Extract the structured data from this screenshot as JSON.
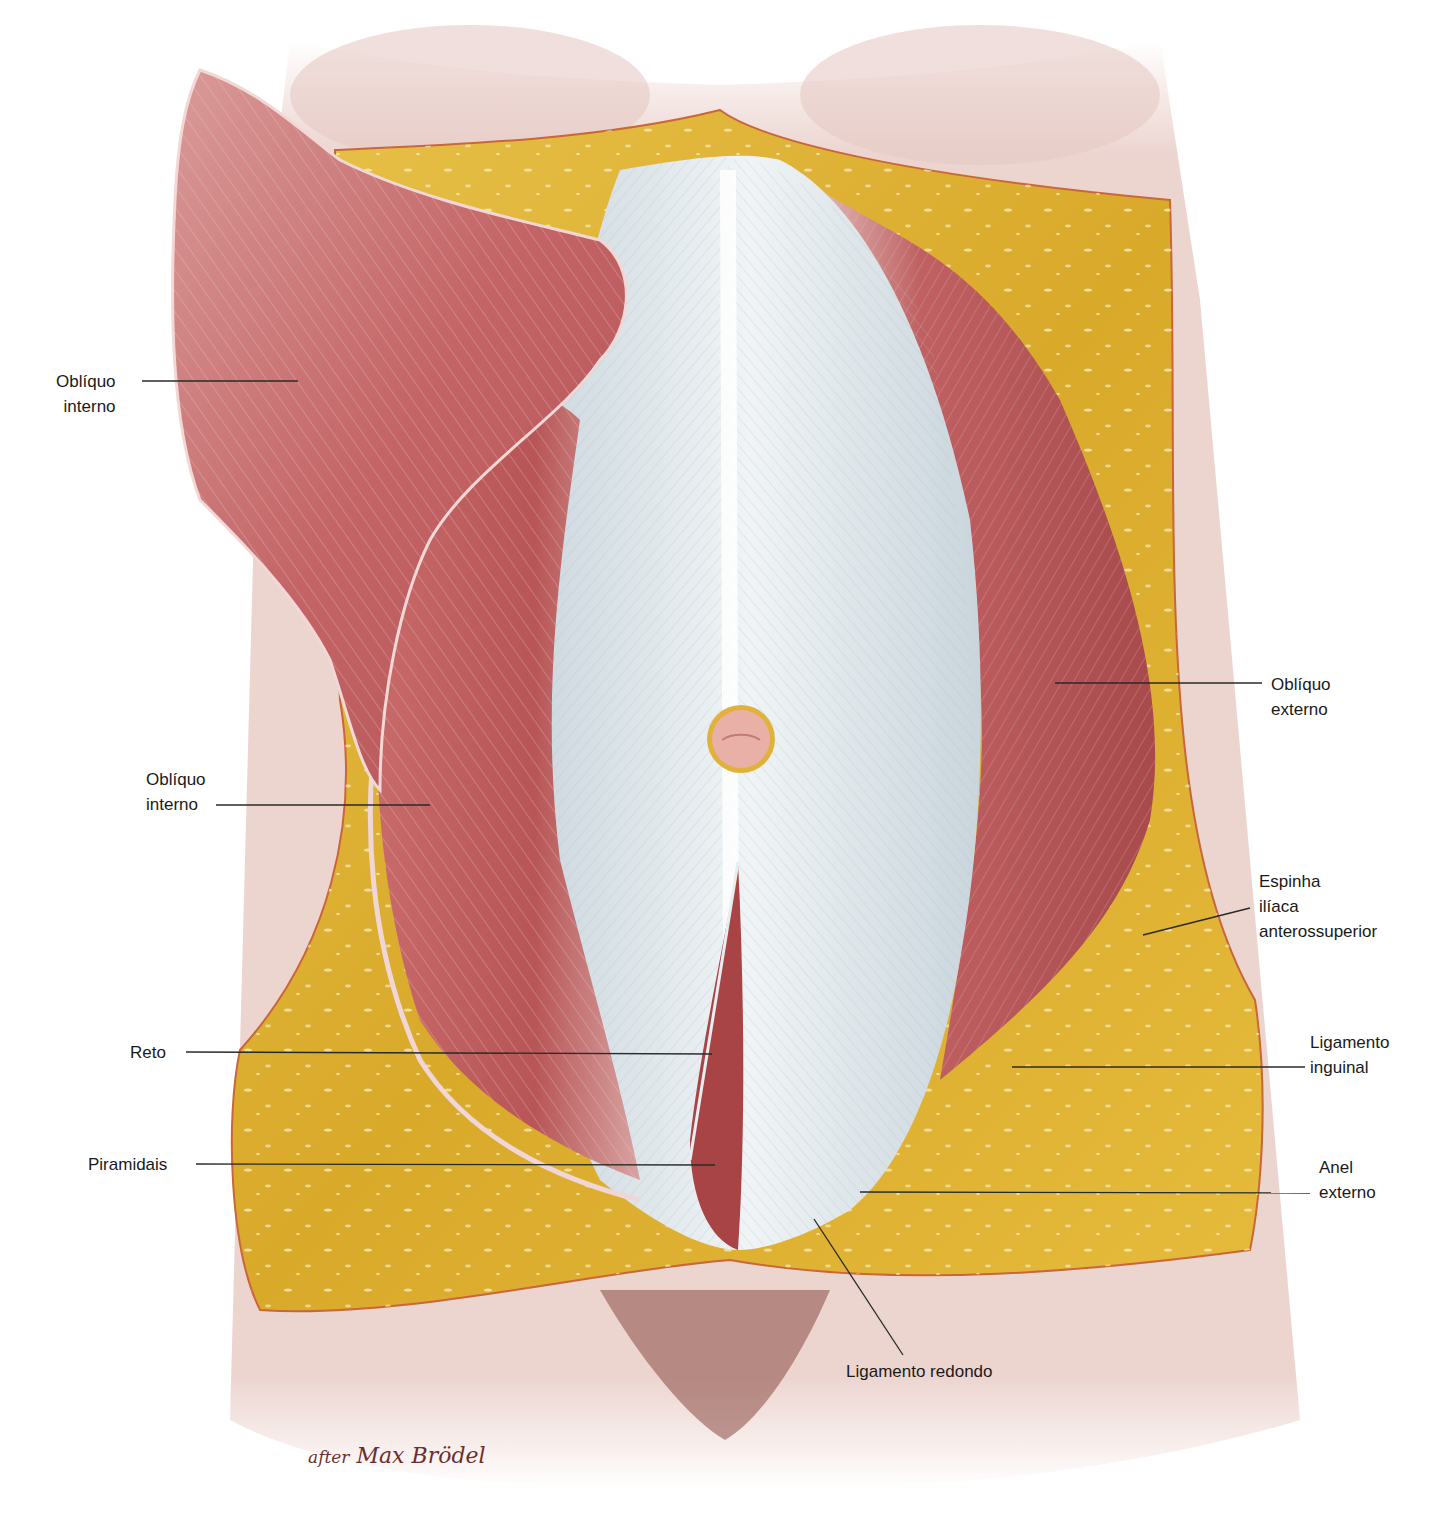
{
  "figure": {
    "credit_prefix": "after",
    "credit_name": "Max Brödel",
    "colors": {
      "skin": "#ecd3cf",
      "fat": "#e2b735",
      "muscle": "#b9585a",
      "muscle_light": "#d98b86",
      "aponeurosis": "#d9e3e8",
      "leader_line": "#2a2a2a",
      "credit_text": "#6b2f2f"
    }
  },
  "labels": [
    {
      "id": "obliquo-interno-upper",
      "lines": "Oblíquo\ninterno"
    },
    {
      "id": "obliquo-interno-lower",
      "lines": "Oblíquo\ninterno"
    },
    {
      "id": "reto",
      "lines": "Reto"
    },
    {
      "id": "piramidais",
      "lines": "Piramidais"
    },
    {
      "id": "obliquo-externo",
      "lines": "Oblíquo\nexterno"
    },
    {
      "id": "espinha-iliaca",
      "lines": "Espinha\nilíaca\nanterossuperior"
    },
    {
      "id": "ligamento-inguinal",
      "lines": "Ligamento\ninguinal"
    },
    {
      "id": "anel-externo",
      "lines": "Anel\nexterno"
    },
    {
      "id": "ligamento-redondo",
      "lines": "Ligamento redondo"
    }
  ]
}
